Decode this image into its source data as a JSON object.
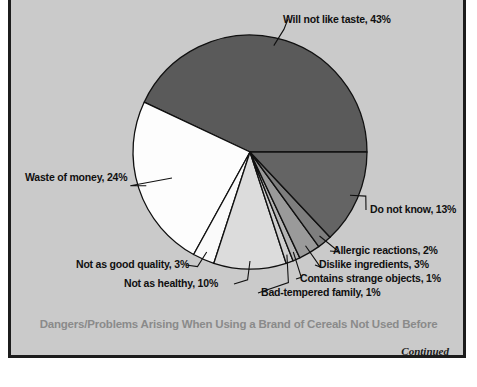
{
  "figure": {
    "caption": "Dangers/Problems Arising When Using a Brand of Cereals Not Used Before",
    "continued_note": "Continued",
    "frame_color": "#1c1c1c",
    "background_color": "#cacaca",
    "caption_color": "#8a8a8a"
  },
  "chart_data": {
    "type": "pie",
    "title": "Dangers/Problems Arising When Using a Brand of Cereals Not Used Before",
    "xlabel": "",
    "ylabel": "",
    "legend_position": "none",
    "grid": false,
    "units": "percent",
    "total": 100,
    "start_angle_deg": 0,
    "direction": "counterclockwise",
    "categories": [
      "Will not like taste",
      "Waste of money",
      "Not as good quality",
      "Not as healthy",
      "Bad-tempered family",
      "Contains strange objects",
      "Dislike ingredients",
      "Allergic reactions",
      "Do not know"
    ],
    "values": [
      43,
      24,
      3,
      10,
      1,
      1,
      3,
      2,
      13
    ],
    "slices": [
      {
        "label": "Will not like taste",
        "value": 43,
        "label_text": "Will not like taste, 43%",
        "color": "#5a5a5a"
      },
      {
        "label": "Waste of money",
        "value": 24,
        "label_text": "Waste of money, 24%",
        "color": "#fdfdfd"
      },
      {
        "label": "Not as good quality",
        "value": 3,
        "label_text": "Not as good quality, 3%",
        "color": "#fafafa"
      },
      {
        "label": "Not as healthy",
        "value": 10,
        "label_text": "Not as healthy, 10%",
        "color": "#dcdcdc"
      },
      {
        "label": "Bad-tempered family",
        "value": 1,
        "label_text": "Bad-tempered family, 1%",
        "color": "#cfcfcf"
      },
      {
        "label": "Contains strange objects",
        "value": 1,
        "label_text": "Contains strange objects, 1%",
        "color": "#b4b4b4"
      },
      {
        "label": "Dislike ingredients",
        "value": 3,
        "label_text": "Dislike ingredients, 3%",
        "color": "#9a9a9a"
      },
      {
        "label": "Allergic reactions",
        "value": 2,
        "label_text": "Allergic reactions, 2%",
        "color": "#7e7e7e"
      },
      {
        "label": "Do not know",
        "value": 13,
        "label_text": "Do not know, 13%",
        "color": "#646464"
      }
    ]
  }
}
